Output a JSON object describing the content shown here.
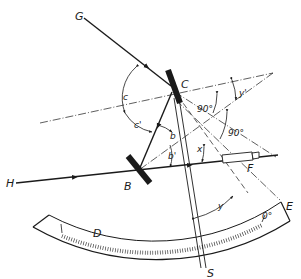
{
  "diagram": {
    "colors": {
      "ink": "#1a1a1a",
      "background": "#ffffff"
    },
    "points": {
      "G": "G",
      "H": "H",
      "C": "C",
      "B": "B",
      "F": "F",
      "D": "D",
      "E": "E",
      "S": "S"
    },
    "angles": {
      "c": "c",
      "c_prime": "c'",
      "b": "b",
      "b_prime": "b'",
      "x": "x",
      "y": "y",
      "y_prime": "y'",
      "right_angle_1": "90°",
      "right_angle_2": "90°"
    },
    "scale": {
      "zero_mark": "0°"
    },
    "components": [
      {
        "id": "index-mirror",
        "label": "C"
      },
      {
        "id": "horizon-mirror",
        "label": "B"
      },
      {
        "id": "telescope",
        "label": "F"
      },
      {
        "id": "arc-scale",
        "label": "D–E"
      },
      {
        "id": "index-arm",
        "label": "S"
      }
    ]
  }
}
